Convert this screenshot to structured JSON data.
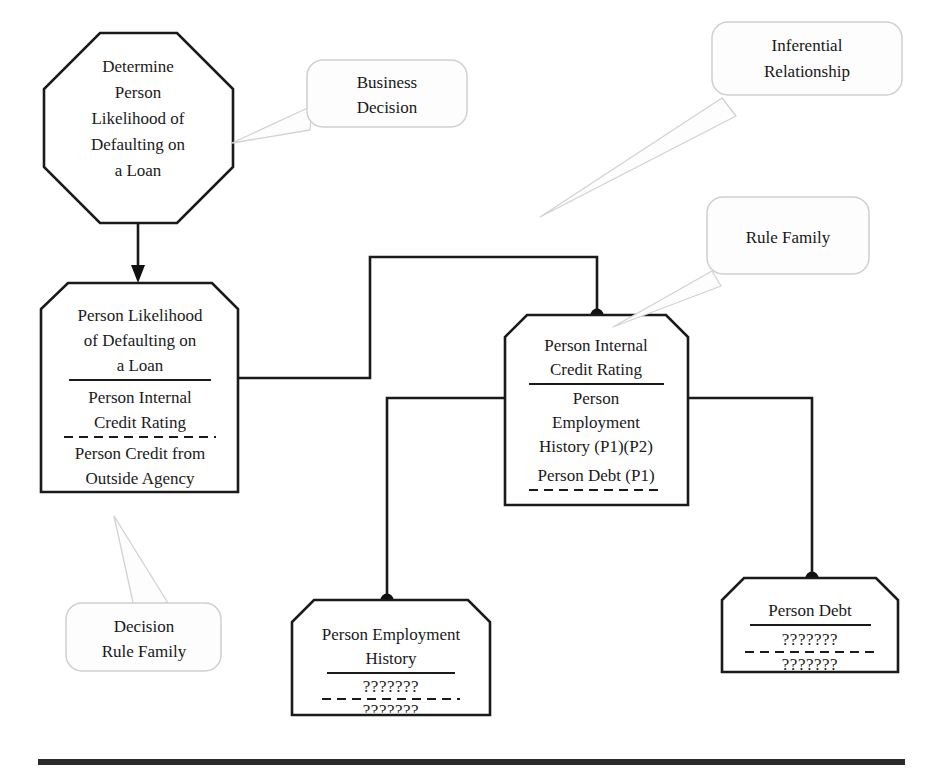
{
  "diagram": {
    "background_color": "#ffffff",
    "line_color": "#1a1a1a",
    "callout_border_color": "#cfcfcf",
    "nodes": {
      "decision": {
        "shape": "octagon",
        "lines": [
          "Determine",
          "Person",
          "Likelihood of",
          "Defaulting on",
          "a Loan"
        ]
      },
      "rule_family_left": {
        "shape": "tag",
        "header": [
          "Person Likelihood",
          "of Defaulting on",
          "a Loan"
        ],
        "section_one": [
          "Person Internal",
          "Credit Rating"
        ],
        "section_two": [
          "Person Credit from",
          "Outside Agency"
        ]
      },
      "rule_family_center": {
        "shape": "tag",
        "header": [
          "Person Internal",
          "Credit Rating"
        ],
        "section_one": [
          "Person",
          "Employment",
          "History (P1)(P2)"
        ],
        "section_two": [
          "Person Debt (P1)"
        ]
      },
      "employment_history": {
        "shape": "tag",
        "header": [
          "Person Employment",
          "History"
        ],
        "section_one": [
          "???????"
        ],
        "section_two": [
          "???????"
        ]
      },
      "person_debt": {
        "shape": "tag",
        "header": [
          "Person Debt"
        ],
        "section_one": [
          "???????"
        ],
        "section_two": [
          "???????"
        ]
      }
    },
    "callouts": {
      "business_decision": {
        "lines": [
          "Business",
          "Decision"
        ]
      },
      "inferential_relationship": {
        "lines": [
          "Inferential",
          "Relationship"
        ]
      },
      "rule_family": {
        "lines": [
          "Rule Family"
        ]
      },
      "decision_rule_family": {
        "lines": [
          "Decision",
          "Rule Family"
        ]
      }
    }
  }
}
